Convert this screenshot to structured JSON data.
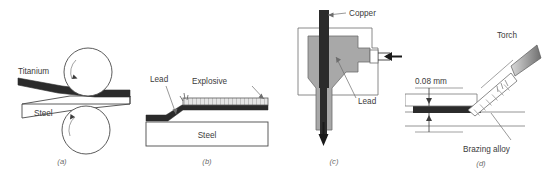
{
  "figure": {
    "background": "#ffffff",
    "colors": {
      "dark_metal": "#2b2b2b",
      "gray_die": "#a8a8a8",
      "light_fill": "#ffffff",
      "outline": "#4a4a4a",
      "leader": "#6d6d6d",
      "text": "#3b3b3b",
      "caption": "#6a6a6a",
      "hatch": "#8c8c8c"
    }
  },
  "panels": [
    {
      "id": "a",
      "caption": "(a)",
      "process": "roll-bonding",
      "labels": {
        "top_strip": "Titanium",
        "bottom_strip": "Steel"
      },
      "icons": [
        "roller-top-icon",
        "roller-bottom-icon",
        "rotation-arrow-icon"
      ]
    },
    {
      "id": "b",
      "caption": "(b)",
      "process": "explosive-welding",
      "labels": {
        "clad_sheet": "Lead",
        "charge_layer": "Explosive",
        "base_plate": "Steel"
      },
      "icons": [
        "detonation-spark-icon",
        "explosive-hatch-icon"
      ]
    },
    {
      "id": "c",
      "caption": "(c)",
      "process": "extrusion-cladding",
      "labels": {
        "core_rod": "Copper",
        "sheath": "Lead"
      },
      "icons": [
        "ram-arrow-icon",
        "extrusion-arrow-icon"
      ]
    },
    {
      "id": "d",
      "caption": "(d)",
      "process": "torch-brazing",
      "labels": {
        "gap_dimension": "0.08 mm",
        "heat_source": "Torch",
        "filler": "Brazing alloy"
      },
      "icons": [
        "torch-icon",
        "flame-icon",
        "dimension-arrow-icon"
      ]
    }
  ]
}
